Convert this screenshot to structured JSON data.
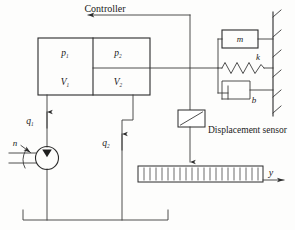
{
  "figure": {
    "type": "schematic-diagram",
    "background_color": "#fdfdfc",
    "line_color": "#3a3a3a",
    "text_color": "#1a1a1a"
  },
  "labels": {
    "controller": "Controller",
    "displacement_sensor": "Displacement sensor",
    "pressure_1": "p",
    "pressure_1_sub": "1",
    "pressure_2": "p",
    "pressure_2_sub": "2",
    "volume_1": "V",
    "volume_1_sub": "1",
    "volume_2": "V",
    "volume_2_sub": "2",
    "flow_1": "q",
    "flow_1_sub": "1",
    "flow_2": "q",
    "flow_2_sub": "2",
    "mass": "m",
    "spring": "k",
    "damper": "b",
    "speed": "n",
    "output_displacement": "y"
  },
  "components": {
    "cylinder": {
      "name": "hydraulic-cylinder",
      "chamber_left": {
        "pressure": "p1",
        "volume": "V1"
      },
      "chamber_right": {
        "pressure": "p2",
        "volume": "V2"
      }
    },
    "pump": {
      "name": "hydraulic-pump",
      "shaft_speed_label": "n",
      "symbol": "circle-with-filled-triangle"
    },
    "load": {
      "name": "mass-spring-damper-load",
      "elements": [
        "m",
        "k",
        "b"
      ]
    },
    "sensor": {
      "name": "displacement-sensor",
      "symbol": "box-with-diagonal"
    },
    "table": {
      "name": "hatched-load-table",
      "output": "y"
    },
    "reservoir": {
      "name": "oil-reservoir-tank"
    },
    "wall": {
      "name": "fixed-wall-hatched"
    }
  },
  "flows": [
    {
      "id": "q1",
      "label": "q",
      "sub": "1",
      "direction": "up",
      "from": "pump",
      "to": "cylinder-chamber-1"
    },
    {
      "id": "q2",
      "label": "q",
      "sub": "2",
      "direction": "up",
      "from": "reservoir",
      "to": "cylinder-chamber-2"
    }
  ],
  "signals": [
    {
      "id": "feedback",
      "label": "Controller",
      "direction": "left",
      "from": "displacement-sensor",
      "to": "controller"
    }
  ]
}
